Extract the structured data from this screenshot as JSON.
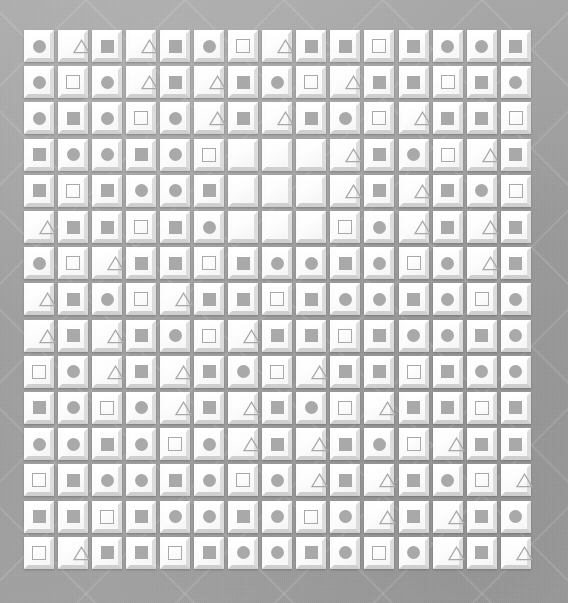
{
  "scene": {
    "title": "Tile grid puzzle board",
    "background_color": "#a0a0a0",
    "tile_color": "#ffffff",
    "shape_color": "#a9a9a9",
    "rows": 15,
    "columns": 15,
    "cell_size_px": 34,
    "grid_origin": {
      "x": 22,
      "y": 28
    },
    "shape_legend": [
      {
        "key": "circle",
        "label": "filled circle"
      },
      {
        "key": "square",
        "label": "filled square"
      },
      {
        "key": "square-outline",
        "label": "outlined square"
      },
      {
        "key": "triangle",
        "label": "outlined triangle"
      },
      {
        "key": "empty",
        "label": "blank tile"
      }
    ]
  },
  "grid": [
    [
      "circle",
      "triangle",
      "square",
      "triangle",
      "square",
      "circle",
      "square-outline",
      "triangle",
      "square",
      "square",
      "square-outline",
      "square",
      "circle",
      "circle",
      "square"
    ],
    [
      "circle",
      "square-outline",
      "circle",
      "triangle",
      "square",
      "triangle",
      "square",
      "circle",
      "square-outline",
      "triangle",
      "square",
      "square",
      "square-outline",
      "square",
      "circle"
    ],
    [
      "circle",
      "square",
      "circle",
      "square-outline",
      "circle",
      "triangle",
      "square",
      "triangle",
      "square",
      "circle",
      "square-outline",
      "triangle",
      "square",
      "square",
      "square-outline"
    ],
    [
      "square",
      "circle",
      "circle",
      "square",
      "circle",
      "square-outline",
      "empty",
      "empty",
      "empty",
      "triangle",
      "square",
      "circle",
      "square-outline",
      "triangle",
      "square"
    ],
    [
      "square",
      "square-outline",
      "square",
      "circle",
      "circle",
      "square",
      "empty",
      "empty",
      "empty",
      "triangle",
      "square",
      "triangle",
      "square",
      "circle",
      "square-outline"
    ],
    [
      "triangle",
      "square",
      "square",
      "square-outline",
      "square",
      "circle",
      "empty",
      "empty",
      "empty",
      "square-outline",
      "circle",
      "triangle",
      "square",
      "triangle",
      "square"
    ],
    [
      "circle",
      "square-outline",
      "triangle",
      "square",
      "square",
      "square-outline",
      "square",
      "circle",
      "circle",
      "square",
      "circle",
      "square-outline",
      "circle",
      "triangle",
      "square"
    ],
    [
      "triangle",
      "square",
      "circle",
      "square-outline",
      "triangle",
      "square",
      "square",
      "square-outline",
      "square",
      "circle",
      "circle",
      "square",
      "circle",
      "square-outline",
      "circle"
    ],
    [
      "triangle",
      "square",
      "triangle",
      "square",
      "circle",
      "square-outline",
      "triangle",
      "square",
      "square",
      "square-outline",
      "square",
      "circle",
      "circle",
      "square",
      "circle"
    ],
    [
      "square-outline",
      "circle",
      "triangle",
      "square",
      "triangle",
      "square",
      "circle",
      "square-outline",
      "triangle",
      "square",
      "square",
      "square-outline",
      "square",
      "circle",
      "circle"
    ],
    [
      "square",
      "circle",
      "square-outline",
      "circle",
      "triangle",
      "square",
      "triangle",
      "square",
      "circle",
      "square-outline",
      "triangle",
      "square",
      "square",
      "square-outline",
      "square"
    ],
    [
      "circle",
      "circle",
      "square",
      "circle",
      "square-outline",
      "circle",
      "triangle",
      "square",
      "triangle",
      "square",
      "circle",
      "square-outline",
      "triangle",
      "square",
      "square"
    ],
    [
      "square-outline",
      "square",
      "circle",
      "circle",
      "square",
      "circle",
      "square-outline",
      "circle",
      "triangle",
      "square",
      "triangle",
      "square",
      "circle",
      "square-outline",
      "triangle"
    ],
    [
      "square",
      "square",
      "square-outline",
      "square",
      "circle",
      "circle",
      "square",
      "circle",
      "square-outline",
      "circle",
      "triangle",
      "square",
      "triangle",
      "square",
      "circle"
    ],
    [
      "square-outline",
      "triangle",
      "square",
      "square",
      "square-outline",
      "square",
      "circle",
      "circle",
      "square",
      "circle",
      "square-outline",
      "circle",
      "triangle",
      "square",
      "triangle"
    ]
  ]
}
